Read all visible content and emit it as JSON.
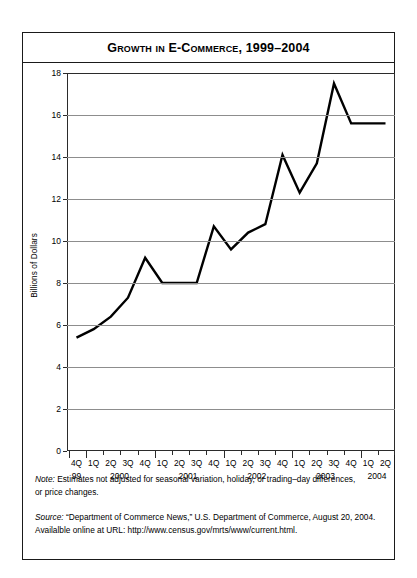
{
  "chart_data": {
    "type": "line",
    "title": "Growth in E-Commerce, 1999–2004",
    "xlabel": "",
    "ylabel": "Billions of Dollars",
    "ylim": [
      0,
      18
    ],
    "ytick_step": 2,
    "grid": true,
    "legend": "none",
    "yticks": [
      "0",
      "2",
      "4",
      "6",
      "8",
      "10",
      "12",
      "14",
      "16",
      "18"
    ],
    "categories": [
      "4Q 99",
      "1Q 2000",
      "2Q 2000",
      "3Q 2000",
      "4Q 2000",
      "1Q 2001",
      "2Q 2001",
      "3Q 2001",
      "4Q 2001",
      "1Q 2002",
      "2Q 2002",
      "3Q 2002",
      "4Q 2002",
      "1Q 2003",
      "2Q 2003",
      "3Q 2003",
      "4Q 2003",
      "1Q 2004",
      "2Q 2004"
    ],
    "quarter_labels": [
      "4Q",
      "1Q",
      "2Q",
      "3Q",
      "4Q",
      "1Q",
      "2Q",
      "3Q",
      "4Q",
      "1Q",
      "2Q",
      "3Q",
      "4Q",
      "1Q",
      "2Q",
      "3Q",
      "4Q",
      "1Q",
      "2Q"
    ],
    "year_labels": [
      "99",
      "2000",
      "2001",
      "2002",
      "2003",
      "2004"
    ],
    "values": [
      5.4,
      5.8,
      6.4,
      7.3,
      9.2,
      8.0,
      8.0,
      8.0,
      10.7,
      9.6,
      10.4,
      10.8,
      14.1,
      12.3,
      13.7,
      17.5,
      15.6,
      15.6,
      15.6
    ],
    "line_color": "#000000"
  },
  "notes": {
    "note": {
      "lead": "Note:",
      "lines": [
        " Estimates not adjusted for seasonal variation, holiday, or trading–day differences,",
        "or price changes."
      ]
    },
    "source": {
      "lead": "Source:",
      "lines": [
        " “Department of Commerce News,” U.S. Department of Commerce, August 20, 2004.",
        "Availalble online at URL: http://www.census.gov/mrts/www/current.html."
      ]
    }
  }
}
